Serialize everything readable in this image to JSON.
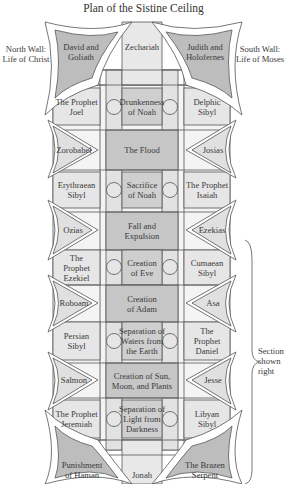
{
  "title": "Plan of the Sistine Ceiling",
  "walls": {
    "north": "North Wall:\nLife of Christ",
    "south": "South Wall:\nLife of Moses"
  },
  "bracket_label": "Section\nshown\nright",
  "colors": {
    "dark_fill": "#bdbdbd",
    "mid_fill": "#cfcfcf",
    "light_fill": "#e6e6e6",
    "line": "#555555"
  },
  "pendentives": {
    "top_left": "David and\nGoliath",
    "top_right": "Judith and\nHolofernes",
    "bottom_left": "Punishment\nof Haman",
    "bottom_right": "The Brazen\nSerpent"
  },
  "end_prophets": {
    "top": "Zechariah",
    "bottom": "Jonah"
  },
  "rows": [
    {
      "type": "seer",
      "left": "The Prophet\nJoel",
      "center": "Drunkenness\nof Noah",
      "right": "Delphic\nSibyl"
    },
    {
      "type": "spandrel",
      "left": "Zorobabel",
      "center": "The Flood",
      "right": "Josias"
    },
    {
      "type": "seer",
      "left": "Erythraean\nSibyl",
      "center": "Sacrifice\nof Noah",
      "right": "The Prophet\nIsaiah"
    },
    {
      "type": "spandrel",
      "left": "Ozias",
      "center": "Fall and\nExpulsion",
      "right": "Ezekias"
    },
    {
      "type": "seer",
      "left": "The\nProphet\nEzekiel",
      "center": "Creation\nof Eve",
      "right": "Cumaean\nSibyl"
    },
    {
      "type": "spandrel",
      "left": "Roboam",
      "center": "Creation\nof Adam",
      "right": "Asa"
    },
    {
      "type": "seer",
      "left": "Persian\nSibyl",
      "center": "Separation of\nWaters from\nthe Earth",
      "right": "The\nProphet\nDaniel"
    },
    {
      "type": "spandrel",
      "left": "Salmon",
      "center": "Creation of Sun,\nMoon, and Plants",
      "right": "Jesse"
    },
    {
      "type": "seer",
      "left": "The Prophet\nJeremiah",
      "center": "Separation of\nLight from\nDarkness",
      "right": "Libyan\nSibyl"
    }
  ]
}
